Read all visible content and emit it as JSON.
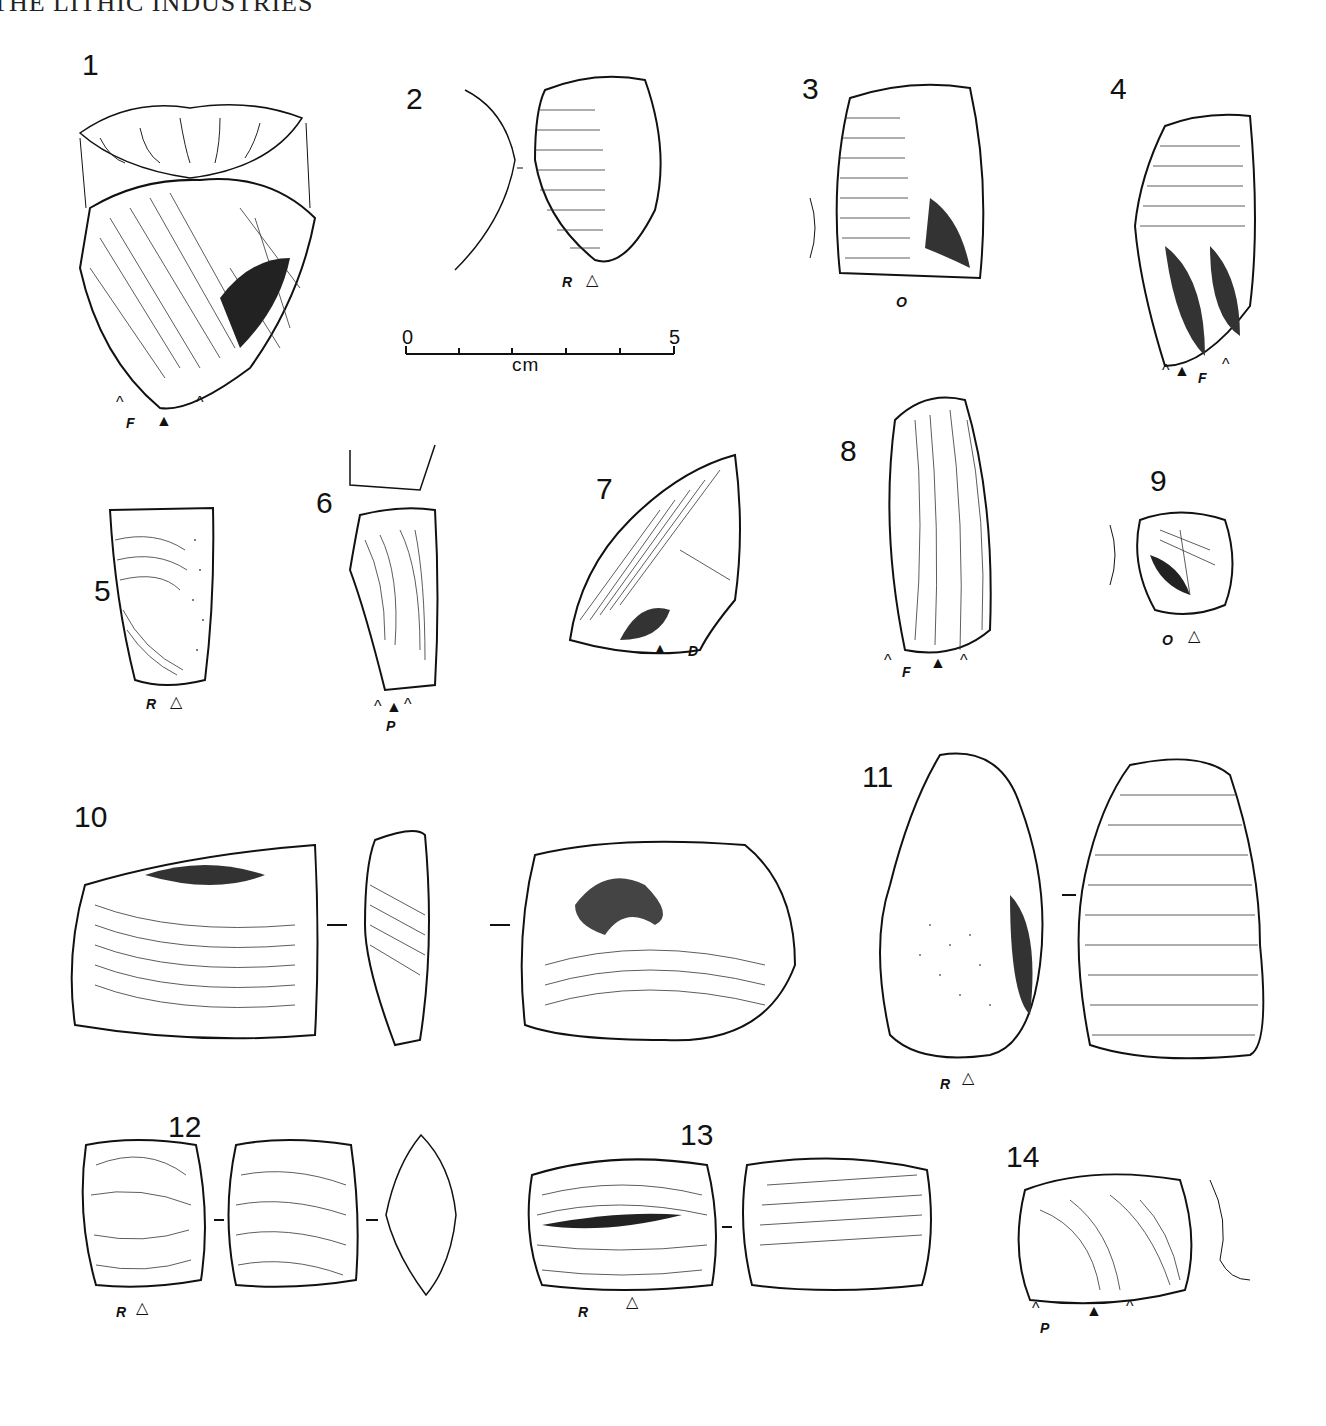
{
  "page": {
    "running_head": "THE LITHIC INDUSTRIES"
  },
  "scale_bar": {
    "start": "0",
    "end": "5",
    "unit": "cm",
    "ticks": 5
  },
  "symbols": {
    "filled_triangle": "▲",
    "open_triangle": "△",
    "caret": "^"
  },
  "figures": [
    {
      "number": "1",
      "label": "F",
      "butt": "▲"
    },
    {
      "number": "2",
      "label": "R",
      "butt": "△"
    },
    {
      "number": "3",
      "label": "O",
      "butt": ""
    },
    {
      "number": "4",
      "label": "F",
      "butt": "▲"
    },
    {
      "number": "5",
      "label": "R",
      "butt": "△"
    },
    {
      "number": "6",
      "label": "P",
      "butt": "▲"
    },
    {
      "number": "7",
      "label": "D",
      "butt": "▲"
    },
    {
      "number": "8",
      "label": "F",
      "butt": "▲"
    },
    {
      "number": "9",
      "label": "O",
      "butt": "△"
    },
    {
      "number": "10",
      "label": "",
      "butt": ""
    },
    {
      "number": "11",
      "label": "R",
      "butt": "△"
    },
    {
      "number": "12",
      "label": "R",
      "butt": "△"
    },
    {
      "number": "13",
      "label": "R",
      "butt": "△"
    },
    {
      "number": "14",
      "label": "P",
      "butt": "▲"
    }
  ]
}
